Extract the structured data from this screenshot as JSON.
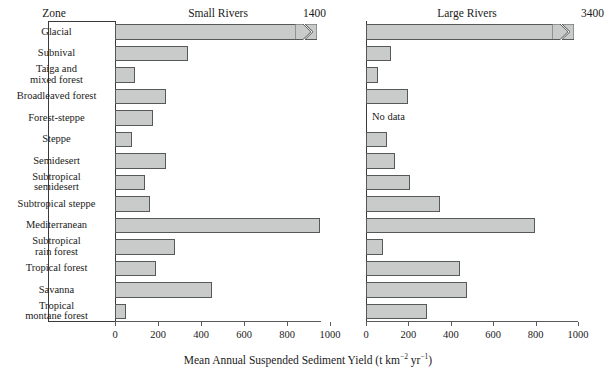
{
  "figure": {
    "zone_header": "Zone",
    "axis_title_main": "Mean Annual Suspended Sediment Yield (t km",
    "axis_title_sup1": "−2",
    "axis_title_mid": " yr",
    "axis_title_sup2": "−1",
    "axis_title_end": ")",
    "no_data_label": "No data"
  },
  "chart_data": {
    "type": "bar",
    "orientation": "horizontal",
    "xlabel": "Mean Annual Suspended Sediment Yield (t km^-2 yr^-1)",
    "ylabel": "Zone",
    "grid": false,
    "legend": "none",
    "categories": [
      "Glacial",
      "Subnival",
      "Taiga and mixed forest",
      "Broadleaved forest",
      "Forest-steppe",
      "Steppe",
      "Semidesert",
      "Subtropical semidesert",
      "Subtropical steppe",
      "Mediterranean",
      "Subtropical rain forest",
      "Tropical forest",
      "Savanna",
      "Tropical montane forest"
    ],
    "category_lines": [
      [
        "Glacial"
      ],
      [
        "Subnival"
      ],
      [
        "Taiga and",
        "mixed forest"
      ],
      [
        "Broadleaved forest"
      ],
      [
        "Forest-steppe"
      ],
      [
        "Steppe"
      ],
      [
        "Semidesert"
      ],
      [
        "Subtropical",
        "semidesert"
      ],
      [
        "Subtropical steppe"
      ],
      [
        "Mediterranean"
      ],
      [
        "Subtropical",
        "rain forest"
      ],
      [
        "Tropical forest"
      ],
      [
        "Savanna"
      ],
      [
        "Tropical",
        "montane forest"
      ]
    ],
    "panels": [
      {
        "name": "Small Rivers",
        "label": "Small Rivers",
        "xlim": [
          0,
          1100
        ],
        "xticks": [
          0,
          200,
          400,
          600,
          800,
          1000
        ],
        "xticklabels": [
          "0",
          "200",
          "400",
          "600",
          "800",
          "1000"
        ],
        "broken_bar_value_label": "1400",
        "values": [
          1400,
          340,
          95,
          235,
          175,
          80,
          235,
          140,
          162,
          953,
          280,
          190,
          450,
          50
        ],
        "broken": [
          true,
          false,
          false,
          false,
          false,
          false,
          false,
          false,
          false,
          false,
          false,
          false,
          false,
          false
        ],
        "no_data": [
          false,
          false,
          false,
          false,
          false,
          false,
          false,
          false,
          false,
          false,
          false,
          false,
          false,
          false
        ]
      },
      {
        "name": "Large Rivers",
        "label": "Large Rivers",
        "xlim": [
          0,
          1130
        ],
        "xticks": [
          0,
          200,
          400,
          600,
          800,
          1000
        ],
        "xticklabels": [
          "0",
          "200",
          "400",
          "600",
          "800",
          "1000"
        ],
        "broken_bar_value_label": "3400",
        "values": [
          3400,
          120,
          57,
          200,
          null,
          97,
          137,
          208,
          350,
          797,
          80,
          443,
          476,
          288
        ],
        "broken": [
          true,
          false,
          false,
          false,
          false,
          false,
          false,
          false,
          false,
          false,
          false,
          false,
          false,
          false
        ],
        "no_data": [
          false,
          false,
          false,
          false,
          true,
          false,
          false,
          false,
          false,
          false,
          false,
          false,
          false,
          false
        ]
      }
    ]
  }
}
